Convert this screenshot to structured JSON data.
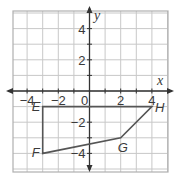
{
  "diagram": {
    "type": "coordinate-plane-polygon",
    "axes": {
      "x_label": "x",
      "y_label": "y",
      "x_ticks": [
        "−4",
        "−2",
        "0",
        "2",
        "4"
      ],
      "y_ticks": [
        "4",
        "2",
        "−2",
        "−4"
      ],
      "x_range": [
        -5,
        5
      ],
      "y_range": [
        -5,
        5
      ],
      "grid_step": 1
    },
    "polygon": {
      "vertices": [
        {
          "label": "E",
          "x": -3,
          "y": -1
        },
        {
          "label": "F",
          "x": -3,
          "y": -4
        },
        {
          "label": "G",
          "x": 2,
          "y": -3
        },
        {
          "label": "H",
          "x": 4,
          "y": -1
        }
      ]
    },
    "colors": {
      "grid": "#c8c8c8",
      "border": "#b0b0b0",
      "axis": "#333333",
      "polygon": "#555555",
      "text": "#3a3a3a"
    }
  }
}
